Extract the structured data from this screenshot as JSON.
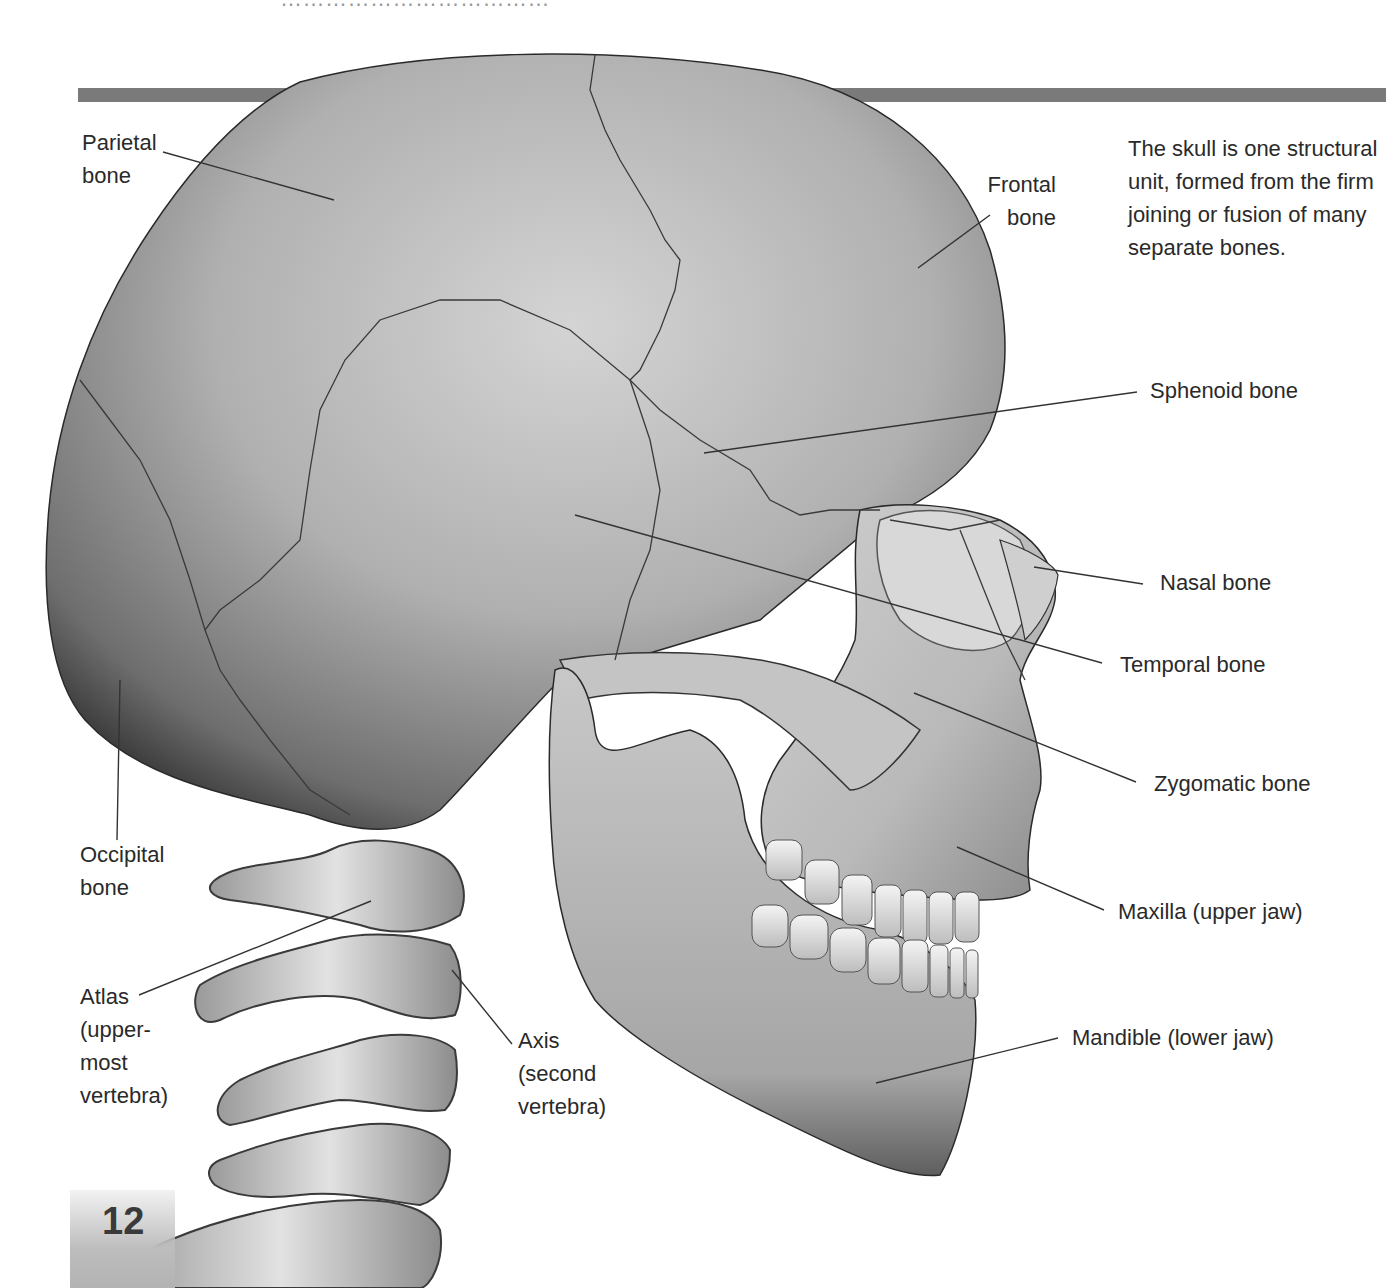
{
  "page": {
    "heading_clipped": "………………………………",
    "page_number": "12",
    "caption": "The skull is one structural unit, formed from the firm joining or fusion of many separate bones.",
    "colors": {
      "header_bar": "#7a7a7a",
      "bone_light": "#e6e6e6",
      "bone_mid": "#a8a8a8",
      "bone_dark": "#4a4a4a",
      "text": "#2a2a2a"
    }
  },
  "labels": {
    "parietal": {
      "line1": "Parietal",
      "line2": "bone"
    },
    "frontal": {
      "line1": "Frontal",
      "line2": "bone"
    },
    "sphenoid": {
      "text": "Sphenoid bone"
    },
    "nasal": {
      "text": "Nasal bone"
    },
    "temporal": {
      "text": "Temporal bone"
    },
    "zygomatic": {
      "text": "Zygomatic bone"
    },
    "maxilla": {
      "text": "Maxilla (upper jaw)"
    },
    "mandible": {
      "text": "Mandible (lower jaw)"
    },
    "occipital": {
      "line1": "Occipital",
      "line2": "bone"
    },
    "atlas": {
      "line1": "Atlas",
      "line2": "(upper-",
      "line3": "most",
      "line4": "vertebra)"
    },
    "axis": {
      "line1": "Axis",
      "line2": "(second",
      "line3": "vertebra)"
    }
  }
}
